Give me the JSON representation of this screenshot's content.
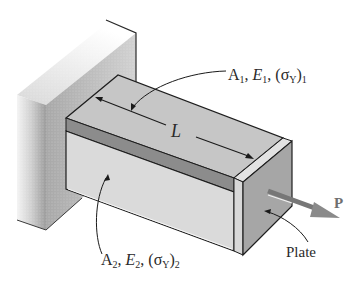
{
  "figure": {
    "type": "engineering-diagram",
    "labels": {
      "top_material": {
        "A": "A",
        "A_sub": "1",
        "E": "E",
        "E_sub": "1",
        "sigma": "(σ",
        "sigma_sub_Y": "Y",
        "close": ")",
        "close_sub": "1",
        "sep": ", "
      },
      "bottom_material": {
        "A": "A",
        "A_sub": "2",
        "E": "E",
        "E_sub": "2",
        "sigma": "(σ",
        "sigma_sub_Y": "Y",
        "close": ")",
        "close_sub": "2",
        "sep": ", "
      },
      "length": "L",
      "force": "P",
      "plate": "Plate"
    },
    "colors": {
      "wall_light": "#e6e6e6",
      "wall_dark": "#9a9a9a",
      "bar_top": "#c9c9c9",
      "bar_stripe": "#8e8e8e",
      "bar_lower": "#dcdcdc",
      "plate_face": "#a8a8a8",
      "plate_edge": "#e0e0e0",
      "force_arrow": "#8a8a8a",
      "line": "#1e1e1e"
    }
  }
}
